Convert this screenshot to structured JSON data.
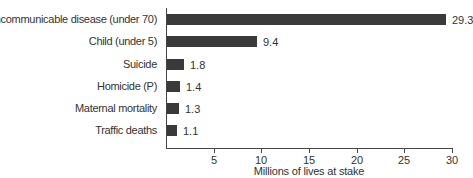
{
  "chart_data": {
    "type": "bar",
    "orientation": "horizontal",
    "title": "",
    "categories": [
      "Noncommunicable disease (under 70)",
      "Child (under 5)",
      "Suicide",
      "Homicide (P)",
      "Maternal mortality",
      "Traffic deaths"
    ],
    "values": [
      29.3,
      9.4,
      1.8,
      1.4,
      1.3,
      1.1
    ],
    "value_labels": [
      "29.3",
      "9.4",
      "1.8",
      "1.4",
      "1.3",
      "1.1"
    ],
    "xlabel": "Millions of lives at stake",
    "ylabel": "",
    "xlim": [
      0,
      30
    ],
    "xticks": [
      "5",
      "10",
      "15",
      "20",
      "25",
      "30"
    ],
    "grid": false,
    "legend": null,
    "bar_color": "#3a3a3a"
  }
}
